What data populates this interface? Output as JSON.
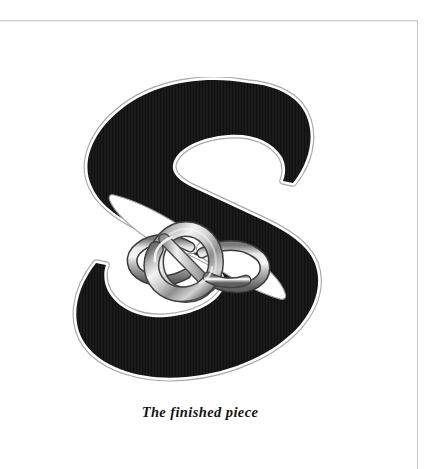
{
  "page": {
    "background_color": "#ffffff",
    "width": 429,
    "height": 469,
    "border_color": "#cfcfcf"
  },
  "figure": {
    "caption": "The finished piece",
    "letter": "S",
    "icon_names": [
      "letter-s-artwork",
      "chain-link-ring-icon",
      "lens-void-upper-icon",
      "lens-void-lower-icon"
    ],
    "colors": {
      "letter_fill": "#1a1a1a",
      "letter_fill_deep": "#101010",
      "letter_outline": "#ffffff",
      "letter_outline_edge": "#9a9a9a",
      "metal_highlight": "#f2f2f2",
      "metal_light": "#d8d8d8",
      "metal_mid": "#b0b0b0",
      "metal_shadow": "#7c7c7c",
      "metal_dark": "#545454"
    }
  }
}
